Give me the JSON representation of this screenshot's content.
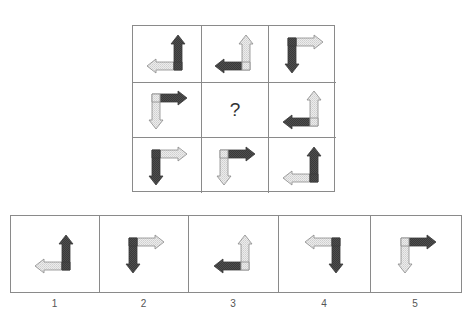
{
  "colors": {
    "dark": "#4a4a4a",
    "light": "#e2e2e2",
    "outline": "#6e6e6e",
    "border": "#8a8a8a"
  },
  "question_mark": "?",
  "grid": [
    {
      "row": 0,
      "col": 0,
      "corner": "BR",
      "h": {
        "dir": "left",
        "shade": "light"
      },
      "v": {
        "dir": "up",
        "shade": "dark"
      }
    },
    {
      "row": 0,
      "col": 1,
      "corner": "BR",
      "h": {
        "dir": "left",
        "shade": "dark"
      },
      "v": {
        "dir": "up",
        "shade": "light"
      }
    },
    {
      "row": 0,
      "col": 2,
      "corner": "TL",
      "h": {
        "dir": "right",
        "shade": "light"
      },
      "v": {
        "dir": "down",
        "shade": "dark"
      }
    },
    {
      "row": 1,
      "col": 0,
      "corner": "TL",
      "h": {
        "dir": "right",
        "shade": "dark"
      },
      "v": {
        "dir": "down",
        "shade": "light"
      }
    },
    {
      "row": 1,
      "col": 1,
      "missing": true
    },
    {
      "row": 1,
      "col": 2,
      "corner": "BR",
      "h": {
        "dir": "left",
        "shade": "dark"
      },
      "v": {
        "dir": "up",
        "shade": "light"
      }
    },
    {
      "row": 2,
      "col": 0,
      "corner": "TL",
      "h": {
        "dir": "right",
        "shade": "light"
      },
      "v": {
        "dir": "down",
        "shade": "dark"
      }
    },
    {
      "row": 2,
      "col": 1,
      "corner": "TL",
      "h": {
        "dir": "right",
        "shade": "dark"
      },
      "v": {
        "dir": "down",
        "shade": "light"
      }
    },
    {
      "row": 2,
      "col": 2,
      "corner": "BR",
      "h": {
        "dir": "left",
        "shade": "light"
      },
      "v": {
        "dir": "up",
        "shade": "dark"
      }
    }
  ],
  "options": [
    {
      "label": "1",
      "corner": "BR",
      "h": {
        "dir": "left",
        "shade": "light"
      },
      "v": {
        "dir": "up",
        "shade": "dark"
      }
    },
    {
      "label": "2",
      "corner": "TL",
      "h": {
        "dir": "right",
        "shade": "light"
      },
      "v": {
        "dir": "down",
        "shade": "dark"
      }
    },
    {
      "label": "3",
      "corner": "BR",
      "h": {
        "dir": "left",
        "shade": "dark"
      },
      "v": {
        "dir": "up",
        "shade": "light"
      }
    },
    {
      "label": "4",
      "corner": "TR",
      "h": {
        "dir": "left",
        "shade": "light"
      },
      "v": {
        "dir": "down",
        "shade": "dark"
      }
    },
    {
      "label": "5",
      "corner": "TL",
      "h": {
        "dir": "right",
        "shade": "dark"
      },
      "v": {
        "dir": "down",
        "shade": "light"
      }
    }
  ],
  "option_widths": [
    89,
    89,
    90,
    92,
    90
  ]
}
